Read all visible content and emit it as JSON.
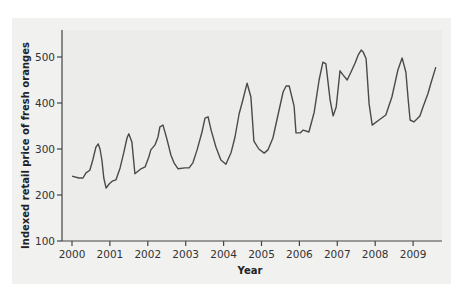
{
  "chart_data": {
    "type": "line",
    "title": "",
    "xlabel": "Year",
    "ylabel": "Indexed retail price of fresh oranges",
    "xlim": [
      2000,
      2009.7
    ],
    "ylim": [
      100,
      550
    ],
    "grid": false,
    "legend": null,
    "x_ticks": [
      "2000",
      "2001",
      "2002",
      "2003",
      "2004",
      "2005",
      "2006",
      "2007",
      "2008",
      "2009"
    ],
    "y_ticks": [
      "100",
      "200",
      "300",
      "400",
      "500"
    ],
    "series": [
      {
        "name": "Indexed retail price of fresh oranges",
        "color": "#4a4a4a",
        "x": [
          2000.0,
          2000.18,
          2000.29,
          2000.37,
          2000.47,
          2000.55,
          2000.63,
          2000.69,
          2000.74,
          2000.79,
          2000.84,
          2000.9,
          2000.98,
          2001.06,
          2001.16,
          2001.27,
          2001.37,
          2001.45,
          2001.5,
          2001.58,
          2001.66,
          2001.82,
          2001.93,
          2002.03,
          2002.08,
          2002.19,
          2002.27,
          2002.32,
          2002.4,
          2002.51,
          2002.61,
          2002.69,
          2002.8,
          2002.98,
          2003.09,
          2003.19,
          2003.3,
          2003.43,
          2003.51,
          2003.59,
          2003.67,
          2003.8,
          2003.93,
          2004.06,
          2004.2,
          2004.3,
          2004.41,
          2004.51,
          2004.62,
          2004.72,
          2004.8,
          2004.93,
          2005.07,
          2005.17,
          2005.3,
          2005.57,
          2005.65,
          2005.73,
          2005.86,
          2005.91,
          2006.02,
          2006.1,
          2006.25,
          2006.39,
          2006.52,
          2006.62,
          2006.7,
          2006.81,
          2006.89,
          2006.97,
          2007.07,
          2007.15,
          2007.26,
          2007.36,
          2007.47,
          2007.55,
          2007.63,
          2007.68,
          2007.76,
          2007.84,
          2007.92,
          2008.1,
          2008.28,
          2008.44,
          2008.6,
          2008.71,
          2008.81,
          2008.87,
          2008.92,
          2009.02,
          2009.1,
          2009.18,
          2009.26,
          2009.39,
          2009.47,
          2009.6
        ],
        "values": [
          241,
          237,
          237,
          248,
          254,
          276,
          304,
          311,
          300,
          276,
          237,
          215,
          224,
          230,
          233,
          259,
          293,
          324,
          333,
          315,
          246,
          257,
          261,
          283,
          298,
          309,
          326,
          348,
          352,
          320,
          287,
          270,
          257,
          259,
          259,
          270,
          298,
          337,
          367,
          370,
          341,
          304,
          276,
          267,
          293,
          326,
          376,
          407,
          443,
          413,
          317,
          300,
          291,
          298,
          324,
          424,
          437,
          437,
          393,
          335,
          335,
          341,
          337,
          380,
          450,
          489,
          485,
          407,
          372,
          391,
          470,
          461,
          450,
          467,
          487,
          504,
          515,
          511,
          496,
          398,
          352,
          363,
          374,
          413,
          472,
          498,
          467,
          407,
          363,
          359,
          365,
          372,
          391,
          420,
          443,
          478
        ]
      }
    ]
  },
  "layout": {
    "plot_left": 62,
    "plot_right": 442,
    "plot_top": 30,
    "plot_bottom": 241,
    "x0_year": 2000,
    "px_per_year": 37.9,
    "y0_value": 100,
    "px_per_unit": 0.46
  }
}
